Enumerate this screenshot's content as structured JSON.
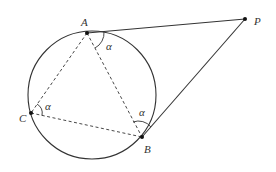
{
  "diagram": {
    "type": "geometry",
    "colors": {
      "stroke": "#333333",
      "background": "#ffffff"
    },
    "circle": {
      "cx": 92,
      "cy": 95,
      "r": 64
    },
    "points": [
      {
        "id": "A",
        "label": "A",
        "x": 87,
        "y": 33,
        "label_x": 81,
        "label_y": 26
      },
      {
        "id": "B",
        "label": "B",
        "x": 142,
        "y": 137,
        "label_x": 144,
        "label_y": 153
      },
      {
        "id": "C",
        "label": "C",
        "x": 31,
        "y": 113,
        "label_x": 19,
        "label_y": 122
      },
      {
        "id": "P",
        "label": "P",
        "x": 245,
        "y": 19,
        "label_x": 254,
        "label_y": 25
      }
    ],
    "solid_segments": [
      {
        "from": "A",
        "to": "P"
      },
      {
        "from": "B",
        "to": "P"
      }
    ],
    "dashed_segments": [
      {
        "from": "A",
        "to": "C"
      },
      {
        "from": "A",
        "to": "B"
      },
      {
        "from": "C",
        "to": "B"
      }
    ],
    "angle_marks": [
      {
        "at": "A",
        "between": "AP-AB",
        "label": "α",
        "label_x": 106,
        "label_y": 50
      },
      {
        "at": "C",
        "between": "CA-CB",
        "label": "α",
        "label_x": 45,
        "label_y": 110
      },
      {
        "at": "B",
        "between": "BA-BP",
        "label": "α",
        "label_x": 139,
        "label_y": 116
      }
    ]
  }
}
